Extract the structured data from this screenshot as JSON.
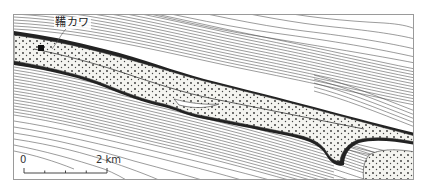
{
  "map": {
    "type": "bathymetric contour map",
    "place_label": "鞴カワ",
    "scale_bar": {
      "start_label": "0",
      "end_label": "2 km",
      "divisions": 4
    },
    "colors": {
      "frame": "#9a9a9a",
      "contour": "#4a4a4a",
      "land_fill": "#f4f4f0",
      "land_dots": "#333333",
      "background": "#ffffff"
    }
  }
}
